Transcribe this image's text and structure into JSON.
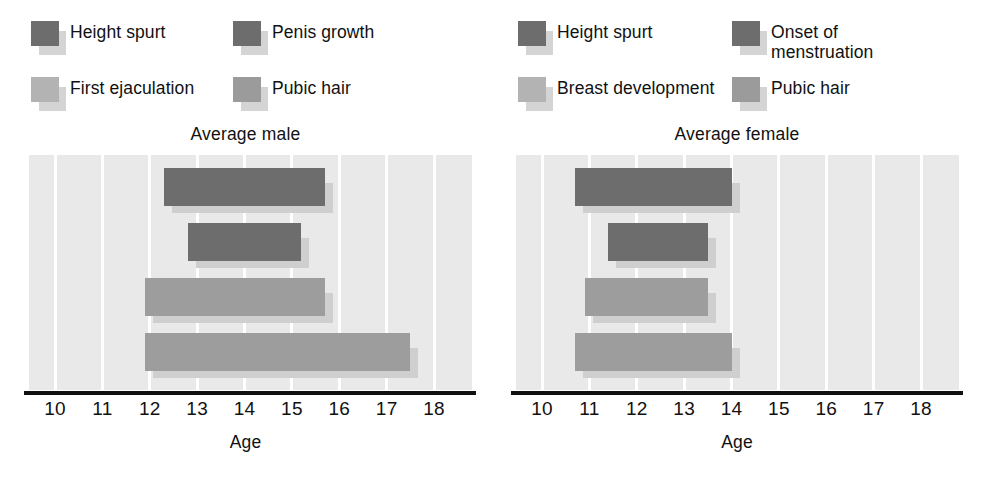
{
  "chart_data": [
    {
      "type": "bar",
      "orientation": "horizontal-range",
      "title": "Average male",
      "xlabel": "Age",
      "ylabel": "",
      "xlim": [
        9.45,
        18.8
      ],
      "xticks": [
        10,
        11,
        12,
        13,
        14,
        15,
        16,
        17,
        18
      ],
      "xticklabels": [
        "10",
        "11",
        "12",
        "13",
        "14",
        "15",
        "16",
        "17",
        "18"
      ],
      "grid": true,
      "grid_axis": "x",
      "legend_position": "above-plot",
      "categories": [
        "Height spurt",
        "Penis growth",
        "Pubic hair",
        "First ejaculation"
      ],
      "series": [
        {
          "name": "Height spurt",
          "start": 12.3,
          "end": 15.7,
          "color": "#6d6d6d"
        },
        {
          "name": "Penis growth",
          "start": 12.8,
          "end": 15.2,
          "color": "#8a8a8a"
        },
        {
          "name": "Pubic hair",
          "start": 11.9,
          "end": 15.7,
          "color": "#9d9d9d"
        },
        {
          "name": "First ejaculation",
          "start": 11.9,
          "end": 17.5,
          "color": "#9d9d9d"
        }
      ]
    },
    {
      "type": "bar",
      "orientation": "horizontal-range",
      "title": "Average female",
      "xlabel": "Age",
      "ylabel": "",
      "xlim": [
        9.45,
        18.8
      ],
      "xticks": [
        10,
        11,
        12,
        13,
        14,
        15,
        16,
        17,
        18
      ],
      "xticklabels": [
        "10",
        "11",
        "12",
        "13",
        "14",
        "15",
        "16",
        "17",
        "18"
      ],
      "grid": true,
      "grid_axis": "x",
      "legend_position": "above-plot",
      "categories": [
        "Height spurt",
        "Onset of menstruation",
        "Pubic hair",
        "Breast development"
      ],
      "series": [
        {
          "name": "Height spurt",
          "start": 10.7,
          "end": 14.0,
          "color": "#6d6d6d"
        },
        {
          "name": "Onset of menstruation",
          "start": 11.4,
          "end": 13.5,
          "color": "#7c7c7c"
        },
        {
          "name": "Pubic hair",
          "start": 10.9,
          "end": 13.5,
          "color": "#9d9d9d"
        },
        {
          "name": "Breast development",
          "start": 10.7,
          "end": 14.0,
          "color": "#8d8d8d"
        }
      ]
    }
  ],
  "panels": [
    {
      "id": "average-male",
      "title": "Average male",
      "axis_title": "Age",
      "legend": [
        {
          "label": "Height spurt",
          "swatch": "dark"
        },
        {
          "label": "First ejaculation",
          "swatch": "light"
        },
        {
          "label": "Penis growth",
          "swatch": "dark"
        },
        {
          "label": "Pubic hair",
          "swatch": "mid"
        }
      ],
      "ticks": [
        "10",
        "11",
        "12",
        "13",
        "14",
        "15",
        "16",
        "17",
        "18"
      ],
      "bars": [
        {
          "name": "Height spurt",
          "start": 12.3,
          "end": 15.7,
          "shade": "dark"
        },
        {
          "name": "Penis growth",
          "start": 12.8,
          "end": 15.2,
          "shade": "dark"
        },
        {
          "name": "Pubic hair",
          "start": 11.9,
          "end": 15.7,
          "shade": "mid"
        },
        {
          "name": "First ejaculation",
          "start": 11.9,
          "end": 17.5,
          "shade": "mid"
        }
      ]
    },
    {
      "id": "average-female",
      "title": "Average female",
      "axis_title": "Age",
      "legend": [
        {
          "label": "Height spurt",
          "swatch": "dark"
        },
        {
          "label": "Breast development",
          "swatch": "light"
        },
        {
          "label": "Onset of menstruation",
          "swatch": "dark"
        },
        {
          "label": "Pubic hair",
          "swatch": "mid"
        }
      ],
      "ticks": [
        "10",
        "11",
        "12",
        "13",
        "14",
        "15",
        "16",
        "17",
        "18"
      ],
      "bars": [
        {
          "name": "Height spurt",
          "start": 10.7,
          "end": 14.0,
          "shade": "dark"
        },
        {
          "name": "Onset of menstruation",
          "start": 11.4,
          "end": 13.5,
          "shade": "dark"
        },
        {
          "name": "Pubic hair",
          "start": 10.9,
          "end": 13.5,
          "shade": "mid"
        },
        {
          "name": "Breast development",
          "start": 10.7,
          "end": 14.0,
          "shade": "mid"
        }
      ]
    }
  ],
  "colors": {
    "plot_background": "#e9e9e9",
    "gridline": "#ffffff",
    "axis": "#111111",
    "bar_dark": "#6d6d6d",
    "bar_mid": "#9d9d9d",
    "bar_light": "#b5b5b5",
    "bar_shadow": "#cfcfcf"
  }
}
